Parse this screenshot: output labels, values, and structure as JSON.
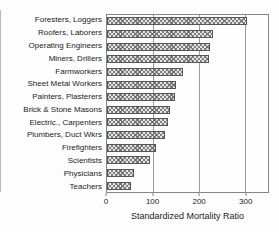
{
  "chart_data": {
    "type": "bar",
    "orientation": "horizontal",
    "title": "",
    "xlabel": "Standardized Mortality Ratio",
    "ylabel": "",
    "categories": [
      "Foresters, Loggers",
      "Roofers, Laborers",
      "Operating Engineers",
      "Miners, Drillers",
      "Farmworkers",
      "Sheet Metal Workers",
      "Painters, Plasterers",
      "Brick & Stone Masons",
      "Electric., Carpenters",
      "Plumbers, Duct Wkrs",
      "Firefighters",
      "Scientists",
      "Physicians",
      "Teachers"
    ],
    "values": [
      305,
      230,
      224,
      221,
      165,
      151,
      147,
      138,
      133,
      125,
      107,
      93,
      58,
      52
    ],
    "xlim": [
      0,
      350
    ],
    "x_ticks": [
      0,
      100,
      200,
      300
    ],
    "grid": "vertical gridlines at labeled x ticks",
    "legend": "none",
    "bar_style": "gray diagonal cross-hatch fill with dark outline"
  },
  "colors": {
    "background": "#fdfdfd",
    "plot_border": "#868686",
    "gridline": "#9d9d9d",
    "bar_fill": "#e3e3e3",
    "bar_hatch": "#606060",
    "bar_outline": "#565656",
    "text": "#1c1c1c"
  }
}
